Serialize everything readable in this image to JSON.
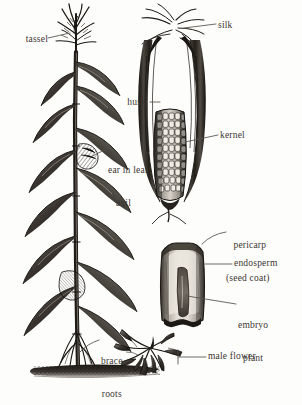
{
  "figure": {
    "medium": "pen-and-ink engraving",
    "ink_color": "#262220",
    "label_color": "#3a3631",
    "background_color": "#fdfdfc",
    "leader_line_color": "#55504a"
  },
  "labels": [
    {
      "id": "tassel",
      "text": "tassel",
      "lines": [
        "tassel"
      ],
      "side": "left",
      "x": 12,
      "y": 34,
      "align": "left"
    },
    {
      "id": "silk",
      "text": "silk",
      "lines": [
        "silk"
      ],
      "side": "right",
      "x": 218,
      "y": 20,
      "align": "right"
    },
    {
      "id": "husk",
      "text": "husk",
      "lines": [
        "husk"
      ],
      "side": "left",
      "x": 120,
      "y": 98,
      "align": "left"
    },
    {
      "id": "kernel",
      "text": "kernel",
      "lines": [
        "kernel"
      ],
      "side": "right",
      "x": 220,
      "y": 131,
      "align": "right"
    },
    {
      "id": "ear-in-leaf-axil",
      "text": "ear in leaf axil",
      "lines": [
        "ear in leaf",
        "axil"
      ],
      "side": "right",
      "x": 108,
      "y": 146,
      "align": "right"
    },
    {
      "id": "pericarp",
      "text": "pericarp (seed coat)",
      "lines": [
        "pericarp",
        "(seed coat)"
      ],
      "side": "right",
      "x": 228,
      "y": 220,
      "align": "right"
    },
    {
      "id": "endosperm",
      "text": "endosperm",
      "lines": [
        "endosperm"
      ],
      "side": "right",
      "x": 234,
      "y": 260,
      "align": "right"
    },
    {
      "id": "embryo-plant",
      "text": "embryo plant",
      "lines": [
        "embryo",
        "plant"
      ],
      "side": "right",
      "x": 238,
      "y": 300,
      "align": "right"
    },
    {
      "id": "brace-roots",
      "text": "brace roots",
      "lines": [
        "brace",
        "roots"
      ],
      "side": "right",
      "x": 101,
      "y": 336,
      "align": "right"
    },
    {
      "id": "male-flower",
      "text": "male flower",
      "lines": [
        "male flower"
      ],
      "side": "right",
      "x": 208,
      "y": 353,
      "align": "right"
    }
  ],
  "parts": [
    {
      "id": "whole-plant",
      "name": "corn plant with stalk and leaves"
    },
    {
      "id": "corn-ear",
      "name": "ear of corn with husk peeled back"
    },
    {
      "id": "kernel-section",
      "name": "kernel cross-section"
    },
    {
      "id": "male-flower-spray",
      "name": "male flower (staminate) spikelets"
    },
    {
      "id": "ground-line",
      "name": "soil line"
    }
  ]
}
